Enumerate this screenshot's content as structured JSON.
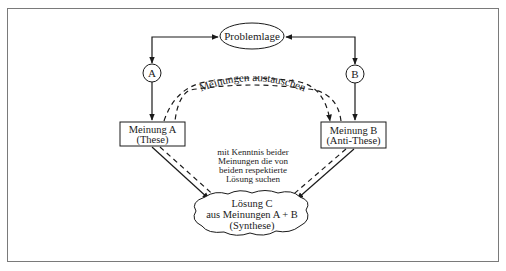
{
  "diagram": {
    "type": "dialectic-process",
    "nodes": {
      "problem": {
        "label": "Problemlage",
        "shape": "ellipse"
      },
      "a_marker": {
        "label": "A",
        "shape": "circle"
      },
      "b_marker": {
        "label": "B",
        "shape": "circle"
      },
      "opinion_a": {
        "line1": "Meinung A",
        "line2": "(These)",
        "shape": "rectangle"
      },
      "opinion_b": {
        "line1": "Meinung B",
        "line2": "(Anti-These)",
        "shape": "rectangle"
      },
      "solution": {
        "line1": "Lösung C",
        "line2": "aus Meinungen A + B",
        "line3": "(Synthese)",
        "shape": "cloud"
      }
    },
    "exchange_label": "Meinungen austauschen",
    "center_note": {
      "line1": "mit Kenntnis beider",
      "line2": "Meinungen die von",
      "line3": "beiden respektierte",
      "line4": "Lösung suchen"
    },
    "edges": [
      {
        "from": "problem",
        "to": "a_marker",
        "style": "solid",
        "bidirectional": true
      },
      {
        "from": "problem",
        "to": "b_marker",
        "style": "solid",
        "bidirectional": true
      },
      {
        "from": "a_marker",
        "to": "opinion_a",
        "style": "solid"
      },
      {
        "from": "b_marker",
        "to": "opinion_b",
        "style": "solid"
      },
      {
        "from": "opinion_a",
        "to": "opinion_b",
        "style": "dashed",
        "label": "Meinungen austauschen",
        "bidirectional": true
      },
      {
        "from": "opinion_a",
        "to": "solution",
        "style": "solid"
      },
      {
        "from": "opinion_b",
        "to": "solution",
        "style": "solid"
      },
      {
        "from": "opinion_a",
        "to": "solution",
        "style": "dashed"
      },
      {
        "from": "opinion_b",
        "to": "solution",
        "style": "dashed"
      }
    ],
    "colors": {
      "line": "#1a1a1a",
      "border": "#7a7a7a",
      "background": "#ffffff"
    }
  }
}
